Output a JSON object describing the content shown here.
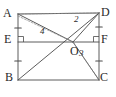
{
  "figure": {
    "type": "geometry-diagram",
    "shape": "rectangle",
    "stroke_color": "#4a4a4a",
    "dashed_color": "#8a8a8a",
    "background_color": "#ffffff",
    "label_color": "#2b2b2b",
    "vertices": [
      {
        "id": "A",
        "label": "A",
        "x": 18,
        "y": 14,
        "label_x": 3,
        "label_y": 7
      },
      {
        "id": "D",
        "label": "D",
        "x": 99,
        "y": 13,
        "label_x": 101,
        "label_y": 6
      },
      {
        "id": "B",
        "label": "B",
        "x": 18,
        "y": 80,
        "label_x": 5,
        "label_y": 71
      },
      {
        "id": "C",
        "label": "C",
        "x": 99,
        "y": 80,
        "label_x": 100,
        "label_y": 71
      },
      {
        "id": "E",
        "label": "E",
        "x": 18,
        "y": 42,
        "label_x": 4,
        "label_y": 33
      },
      {
        "id": "F",
        "label": "F",
        "x": 99,
        "y": 42,
        "label_x": 101,
        "label_y": 33
      },
      {
        "id": "O",
        "label": "O",
        "x": 73,
        "y": 42,
        "label_x": 70,
        "label_y": 45
      }
    ],
    "angle_labels": [
      {
        "id": "angle-2",
        "label": "2",
        "x": 74,
        "y": 15
      },
      {
        "id": "angle-3",
        "label": "3",
        "x": 79,
        "y": 49
      },
      {
        "id": "angle-4",
        "label": "4",
        "x": 40,
        "y": 27
      }
    ],
    "solid_segments": [
      {
        "name": "side-AD",
        "x1": 18,
        "y1": 14,
        "x2": 99,
        "y2": 13
      },
      {
        "name": "side-AB",
        "x1": 18,
        "y1": 14,
        "x2": 18,
        "y2": 80
      },
      {
        "name": "side-BC",
        "x1": 18,
        "y1": 80,
        "x2": 99,
        "y2": 80
      },
      {
        "name": "side-DC",
        "x1": 99,
        "y1": 13,
        "x2": 99,
        "y2": 80
      },
      {
        "name": "segment-EF",
        "x1": 18,
        "y1": 42,
        "x2": 99,
        "y2": 42
      },
      {
        "name": "segment-AO",
        "x1": 18,
        "y1": 14,
        "x2": 73,
        "y2": 42
      },
      {
        "name": "segment-OD",
        "x1": 73,
        "y1": 42,
        "x2": 99,
        "y2": 13
      },
      {
        "name": "segment-OC",
        "x1": 73,
        "y1": 42,
        "x2": 99,
        "y2": 80
      },
      {
        "name": "segment-BO-extended",
        "x1": 18,
        "y1": 80,
        "x2": 99,
        "y2": 13
      }
    ],
    "dashed_segments": [
      {
        "name": "dashed-AO-upper",
        "x1": 18,
        "y1": 16,
        "x2": 73,
        "y2": 42
      },
      {
        "name": "dashed-AD-diagonal",
        "x1": 18,
        "y1": 14,
        "x2": 99,
        "y2": 13
      },
      {
        "name": "dashed-OC",
        "x1": 73,
        "y1": 42,
        "x2": 99,
        "y2": 80
      }
    ],
    "tick_marks": [
      {
        "name": "tick-AE",
        "x": 18,
        "y": 28
      },
      {
        "name": "tick-EB",
        "x": 18,
        "y": 61
      },
      {
        "name": "tick-DF",
        "x": 99,
        "y": 27
      },
      {
        "name": "tick-FC",
        "x": 99,
        "y": 61
      }
    ],
    "right_angle_marks": [
      {
        "name": "right-angle-at-E",
        "x": 18,
        "y": 42,
        "dir_x": 1,
        "dir_y": -1
      },
      {
        "name": "right-angle-at-F",
        "x": 99,
        "y": 42,
        "dir_x": -1,
        "dir_y": -1
      }
    ]
  }
}
